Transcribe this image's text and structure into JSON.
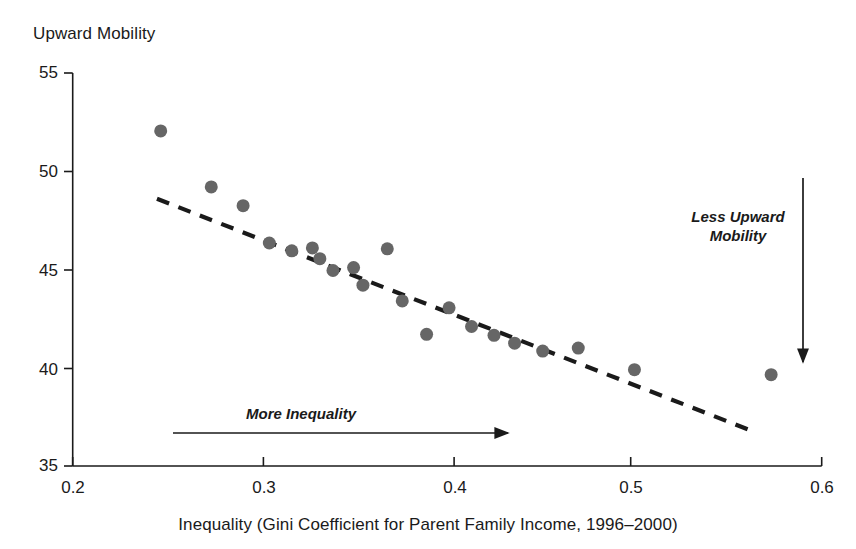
{
  "chart_data": {
    "type": "scatter",
    "title": "",
    "ylabel": "Upward Mobility",
    "xlabel": "Inequality (Gini Coefficient for Parent Family Income, 1996–2000)",
    "xlim": [
      0.2,
      0.6
    ],
    "ylim": [
      35,
      55
    ],
    "grid": false,
    "legend": "none",
    "xticks": [
      "0.2",
      "0.3",
      "0.4",
      "0.5",
      "0.6"
    ],
    "xtick_values": [
      0.2,
      0.3,
      0.4,
      0.5,
      0.6
    ],
    "yticks": [
      "55",
      "50",
      "45",
      "40",
      "35"
    ],
    "ytick_values": [
      55,
      50,
      45,
      40,
      35
    ],
    "marker_color": "#666666",
    "marker_size": 13,
    "points": [
      {
        "x": 0.247,
        "y": 52.05
      },
      {
        "x": 0.274,
        "y": 49.2
      },
      {
        "x": 0.291,
        "y": 48.25
      },
      {
        "x": 0.305,
        "y": 46.35
      },
      {
        "x": 0.317,
        "y": 45.95
      },
      {
        "x": 0.328,
        "y": 46.1
      },
      {
        "x": 0.332,
        "y": 45.55
      },
      {
        "x": 0.339,
        "y": 44.95
      },
      {
        "x": 0.35,
        "y": 45.1
      },
      {
        "x": 0.355,
        "y": 44.2
      },
      {
        "x": 0.368,
        "y": 46.05
      },
      {
        "x": 0.376,
        "y": 43.4
      },
      {
        "x": 0.389,
        "y": 41.7
      },
      {
        "x": 0.401,
        "y": 43.05
      },
      {
        "x": 0.413,
        "y": 42.1
      },
      {
        "x": 0.425,
        "y": 41.65
      },
      {
        "x": 0.436,
        "y": 41.25
      },
      {
        "x": 0.451,
        "y": 40.85
      },
      {
        "x": 0.47,
        "y": 41.0
      },
      {
        "x": 0.5,
        "y": 39.9
      },
      {
        "x": 0.573,
        "y": 39.65
      }
    ],
    "trendline": {
      "style": "dashed",
      "color": "#1a1a1a",
      "x_start": 0.245,
      "y_start": 48.6,
      "x_end": 0.565,
      "y_end": 36.7
    },
    "annotations": [
      {
        "name": "less-upward-mobility",
        "text": "Less Upward\nMobility",
        "line1": "Less Upward",
        "line2": "Mobility",
        "arrow": "down",
        "italic": true
      },
      {
        "name": "more-inequality",
        "text": "More Inequality",
        "line1": "More Inequality",
        "arrow": "right",
        "italic": true
      }
    ]
  },
  "axis": {
    "ylabel_top": "Upward Mobility",
    "xlabel": "Inequality (Gini Coefficient for Parent Family Income, 1996–2000)",
    "y_ticks": [
      {
        "label": "55"
      },
      {
        "label": "50"
      },
      {
        "label": "45"
      },
      {
        "label": "40"
      },
      {
        "label": "35"
      }
    ],
    "x_ticks": [
      {
        "label": "0.2"
      },
      {
        "label": "0.3"
      },
      {
        "label": "0.4"
      },
      {
        "label": "0.5"
      },
      {
        "label": "0.6"
      }
    ]
  },
  "annotations": {
    "less_upward_line1": "Less Upward",
    "less_upward_line2": "Mobility",
    "more_inequality": "More Inequality"
  },
  "colors": {
    "marker": "#666666",
    "axis": "#1a1a1a",
    "background": "#ffffff"
  }
}
